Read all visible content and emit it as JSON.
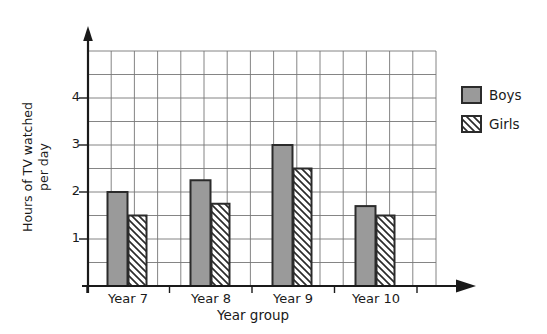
{
  "chart_data": {
    "type": "bar",
    "title": "",
    "categories": [
      "Year 7",
      "Year 8",
      "Year 9",
      "Year 10"
    ],
    "series": [
      {
        "name": "Boys",
        "values": [
          2.0,
          2.25,
          3.0,
          1.7
        ]
      },
      {
        "name": "Girls",
        "values": [
          1.5,
          1.75,
          2.5,
          1.5
        ]
      }
    ],
    "xlabel": "Year group",
    "ylabel": "Hours of TV watched per day",
    "ylabel_lines": [
      "Hours of TV watched",
      "per day"
    ],
    "yticks": [
      1,
      2,
      3,
      4
    ],
    "ylim": [
      0,
      5
    ],
    "grid": true,
    "grid_step": 0.5,
    "legend_position": "right",
    "colors": {
      "boys_fill": "#9a9a9a",
      "girls_fill": "#ffffff",
      "bar_outline": "#2b2b2b",
      "hatch_stroke": "#2b2b2b",
      "grid_line": "#777777",
      "axis_line": "#1a1a1a",
      "text": "#1a1a1a",
      "background": "#ffffff"
    }
  }
}
